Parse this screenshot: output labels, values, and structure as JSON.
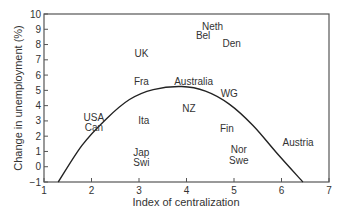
{
  "chart_data": {
    "type": "scatter",
    "title": "",
    "xlabel": "Index of centralization",
    "ylabel": "Change in unemployment (%)",
    "xlim": [
      1,
      7
    ],
    "ylim": [
      -1,
      10
    ],
    "xticks": [
      1,
      2,
      3,
      4,
      5,
      6,
      7
    ],
    "yticks": [
      -1,
      0,
      1,
      2,
      3,
      4,
      5,
      6,
      7,
      8,
      9,
      10
    ],
    "grid": false,
    "legend": null,
    "points": [
      {
        "label": "Neth",
        "x": 4.55,
        "y": 9.2
      },
      {
        "label": "Bel",
        "x": 4.35,
        "y": 8.6
      },
      {
        "label": "Den",
        "x": 4.95,
        "y": 8.1
      },
      {
        "label": "UK",
        "x": 3.05,
        "y": 7.4
      },
      {
        "label": "Fra",
        "x": 3.05,
        "y": 5.6
      },
      {
        "label": "Australia",
        "x": 4.15,
        "y": 5.6
      },
      {
        "label": "WG",
        "x": 4.9,
        "y": 4.8
      },
      {
        "label": "NZ",
        "x": 4.05,
        "y": 3.8
      },
      {
        "label": "USA",
        "x": 2.05,
        "y": 3.2
      },
      {
        "label": "Can",
        "x": 2.05,
        "y": 2.6
      },
      {
        "label": "Ita",
        "x": 3.1,
        "y": 3.0
      },
      {
        "label": "Fin",
        "x": 4.85,
        "y": 2.5
      },
      {
        "label": "Austria",
        "x": 6.35,
        "y": 1.6
      },
      {
        "label": "Jap",
        "x": 3.05,
        "y": 0.9
      },
      {
        "label": "Swi",
        "x": 3.05,
        "y": 0.3
      },
      {
        "label": "Nor",
        "x": 5.1,
        "y": 1.1
      },
      {
        "label": "Swe",
        "x": 5.1,
        "y": 0.4
      }
    ],
    "curve": {
      "type": "inverted-parabola fit",
      "x": [
        1.3,
        1.8,
        2.3,
        2.8,
        3.3,
        3.9,
        4.4,
        4.9,
        5.4,
        5.9,
        6.45
      ],
      "y": [
        -1.0,
        1.4,
        3.1,
        4.4,
        5.05,
        5.25,
        4.95,
        4.1,
        2.7,
        0.9,
        -1.0
      ]
    }
  }
}
